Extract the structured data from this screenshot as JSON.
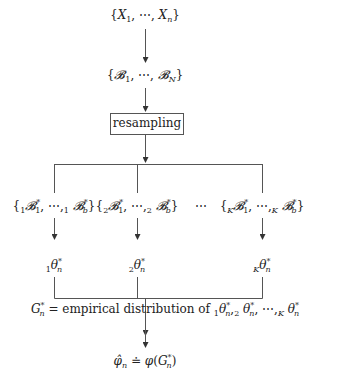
{
  "diagram": {
    "type": "bootstrap-flowchart",
    "nodes": {
      "sample": "{X_1, ⋯, X_n}",
      "blocks": "{𝓑_1, ⋯, 𝓑_N}",
      "resampling": "resampling",
      "bootstrap_sets": [
        "{₁𝓑*_1, ⋯, ₁𝓑*_b}",
        "{₂𝓑*_1, ⋯, ₂𝓑*_b}",
        "{_K𝓑*_1, ⋯, _K𝓑*_b}"
      ],
      "ellipsis": "⋯",
      "estimates": [
        "₁θ*_n",
        "₂θ*_n",
        "_Kθ*_n"
      ],
      "empirical": "G*_n = empirical distribution of ₁θ*_n, ₂θ*_n, ⋯, _Kθ*_n",
      "result": "φ̂_n ≐ φ(G*_n)"
    },
    "labels": {
      "resampling_text": "resampling",
      "ellipsis_text": "⋯",
      "empirical_text": " empirical distribution of ",
      "equals": " = ",
      "doteq": " ≐ "
    }
  }
}
